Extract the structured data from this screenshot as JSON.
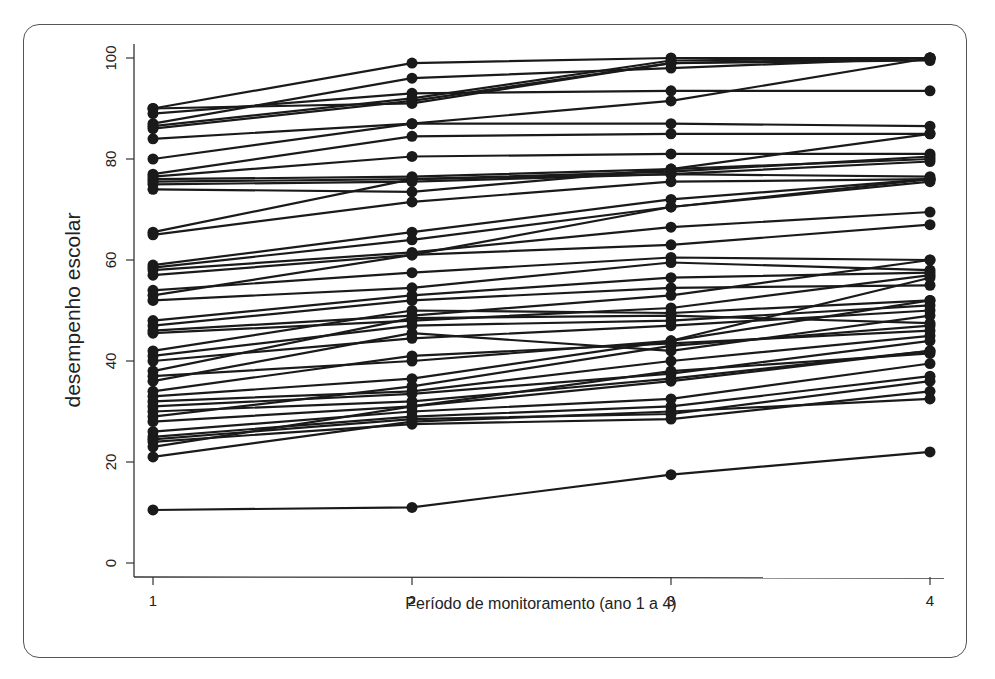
{
  "chart_data": {
    "type": "line",
    "title": "",
    "xlabel": "Período de monitoramento (ano 1 a 4)",
    "ylabel": "desempenho escolar",
    "x": [
      1,
      2,
      3,
      4
    ],
    "xticks": [
      "1",
      "2",
      "3",
      "4"
    ],
    "yticks": [
      "0",
      "20",
      "40",
      "60",
      "80",
      "100"
    ],
    "ylim": [
      0,
      100
    ],
    "xlim": [
      1,
      4
    ],
    "grid": false,
    "legend": "none",
    "marker": "filled-circle",
    "line_color": "#1a1a1a",
    "series": [
      {
        "name": "s1",
        "values": [
          90,
          99,
          100,
          100
        ]
      },
      {
        "name": "s2",
        "values": [
          90,
          91,
          99,
          100
        ]
      },
      {
        "name": "s3",
        "values": [
          89,
          93,
          93.5,
          93.5
        ]
      },
      {
        "name": "s4",
        "values": [
          87,
          96,
          98,
          100
        ]
      },
      {
        "name": "s5",
        "values": [
          86,
          91.5,
          99,
          99.5
        ]
      },
      {
        "name": "s6",
        "values": [
          86.5,
          92,
          99.5,
          100
        ]
      },
      {
        "name": "s7",
        "values": [
          84,
          87,
          87,
          86.5
        ]
      },
      {
        "name": "s8",
        "values": [
          80,
          87,
          91.5,
          100
        ]
      },
      {
        "name": "s9",
        "values": [
          77,
          84.5,
          85,
          85
        ]
      },
      {
        "name": "s10",
        "values": [
          76.5,
          80.5,
          81,
          81
        ]
      },
      {
        "name": "s11",
        "values": [
          76,
          76.5,
          78,
          80
        ]
      },
      {
        "name": "s12",
        "values": [
          75.5,
          76,
          77.5,
          80.5
        ]
      },
      {
        "name": "s13",
        "values": [
          75,
          75.5,
          77,
          79.5
        ]
      },
      {
        "name": "s14",
        "values": [
          74,
          73.5,
          78,
          85
        ]
      },
      {
        "name": "s15",
        "values": [
          65.5,
          76,
          77,
          76.5
        ]
      },
      {
        "name": "s16",
        "values": [
          65,
          71.5,
          75.5,
          76
        ]
      },
      {
        "name": "s17",
        "values": [
          59,
          65.5,
          72,
          76
        ]
      },
      {
        "name": "s18",
        "values": [
          58.5,
          64,
          70.5,
          76
        ]
      },
      {
        "name": "s19",
        "values": [
          58,
          61.5,
          66.5,
          69.5
        ]
      },
      {
        "name": "s20",
        "values": [
          57,
          61,
          63,
          67
        ]
      },
      {
        "name": "s21",
        "values": [
          54,
          57.5,
          60.5,
          60
        ]
      },
      {
        "name": "s22",
        "values": [
          53,
          61,
          70.5,
          75.5
        ]
      },
      {
        "name": "s23",
        "values": [
          52,
          54.5,
          59.5,
          58
        ]
      },
      {
        "name": "s24",
        "values": [
          48,
          53,
          56.5,
          57.5
        ]
      },
      {
        "name": "s25",
        "values": [
          47,
          52,
          54.5,
          55
        ]
      },
      {
        "name": "s26",
        "values": [
          46,
          49,
          53,
          60
        ]
      },
      {
        "name": "s27",
        "values": [
          45.5,
          48,
          50.5,
          57
        ]
      },
      {
        "name": "s28",
        "values": [
          42,
          50,
          49.5,
          52
        ]
      },
      {
        "name": "s29",
        "values": [
          41,
          47,
          48,
          51
        ]
      },
      {
        "name": "s30",
        "values": [
          40,
          44.5,
          47,
          50
        ]
      },
      {
        "name": "s31",
        "values": [
          38,
          48.5,
          49,
          47.5
        ]
      },
      {
        "name": "s32",
        "values": [
          37,
          40,
          44,
          56.5
        ]
      },
      {
        "name": "s33",
        "values": [
          36,
          45.5,
          42,
          49
        ]
      },
      {
        "name": "s34",
        "values": [
          34,
          41,
          43.5,
          46
        ]
      },
      {
        "name": "s35",
        "values": [
          33,
          36.5,
          44,
          52
        ]
      },
      {
        "name": "s36",
        "values": [
          32,
          34,
          40,
          45
        ]
      },
      {
        "name": "s37",
        "values": [
          31,
          33.5,
          37.5,
          44
        ]
      },
      {
        "name": "s38",
        "values": [
          30,
          32,
          36.5,
          42
        ]
      },
      {
        "name": "s39",
        "values": [
          29,
          35,
          43,
          47
        ]
      },
      {
        "name": "s40",
        "values": [
          28,
          31,
          38,
          41.5
        ]
      },
      {
        "name": "s41",
        "values": [
          26,
          30,
          32.5,
          39.5
        ]
      },
      {
        "name": "s42",
        "values": [
          25,
          29,
          31,
          37
        ]
      },
      {
        "name": "s43",
        "values": [
          24.5,
          28.5,
          29.5,
          36
        ]
      },
      {
        "name": "s44",
        "values": [
          24,
          27.5,
          28.5,
          34
        ]
      },
      {
        "name": "s45",
        "values": [
          23,
          31,
          36,
          42
        ]
      },
      {
        "name": "s46",
        "values": [
          21,
          28,
          30,
          32.5
        ]
      },
      {
        "name": "s47",
        "values": [
          10.5,
          11,
          17.5,
          22
        ]
      }
    ]
  }
}
